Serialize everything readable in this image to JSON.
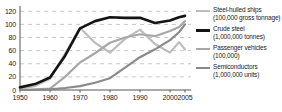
{
  "chart_data": {
    "type": "line",
    "title": "",
    "subtitle": "",
    "xlabel": "",
    "ylabel": "",
    "xlim": [
      1950,
      2007
    ],
    "ylim": [
      0,
      125
    ],
    "grid": true,
    "grid_style": "dashed-horizontal",
    "legend_position": "right",
    "y_ticks": [
      0,
      20,
      40,
      60,
      80,
      100,
      120
    ],
    "x_ticks": [
      1950,
      1960,
      1970,
      1980,
      1990,
      2000,
      2005
    ],
    "x_tick_labels": [
      "1950",
      "1960",
      "1970",
      "1980",
      "1990",
      "2000",
      "2005"
    ],
    "y_tick_labels": [
      "0",
      "20",
      "40",
      "60",
      "80",
      "100",
      "120"
    ],
    "series": [
      {
        "name": "Steel-hulled ships",
        "unit": "(100,000 gross tonnage)",
        "color": "#bdbdbd",
        "width": 2.2,
        "x": [
          1950,
          1955,
          1960,
          1965,
          1970,
          1975,
          1980,
          1985,
          1990,
          1995,
          2000,
          2003,
          2005
        ],
        "y": [
          2,
          6,
          17,
          55,
          95,
          72,
          57,
          78,
          92,
          70,
          57,
          73,
          62
        ]
      },
      {
        "name": "Crude steel",
        "unit": "(1,000,000 tonnes)",
        "color": "#141414",
        "width": 2.6,
        "x": [
          1950,
          1955,
          1960,
          1965,
          1970,
          1975,
          1980,
          1985,
          1990,
          1995,
          2000,
          2003,
          2005
        ],
        "y": [
          4,
          9,
          19,
          52,
          94,
          105,
          111,
          110,
          110,
          102,
          106,
          111,
          113
        ]
      },
      {
        "name": "Passenger vehicles",
        "unit": "(100,000)",
        "color": "#a8a8a8",
        "width": 2.2,
        "x": [
          1950,
          1955,
          1960,
          1965,
          1970,
          1975,
          1980,
          1985,
          1990,
          1995,
          2000,
          2003,
          2005
        ],
        "y": [
          0,
          1,
          2,
          20,
          42,
          56,
          72,
          80,
          85,
          82,
          90,
          96,
          105
        ]
      },
      {
        "name": "Semiconductors",
        "unit": "(1,000,000 units)",
        "color": "#8a8a8a",
        "width": 2.2,
        "x": [
          1950,
          1955,
          1960,
          1965,
          1970,
          1975,
          1980,
          1985,
          1990,
          1995,
          2000,
          2003,
          2005
        ],
        "y": [
          0,
          0,
          1,
          3,
          6,
          11,
          18,
          34,
          50,
          62,
          76,
          88,
          100
        ]
      }
    ]
  },
  "legend": {
    "items": [
      {
        "label": "Steel-hulled ships",
        "unit": "(100,000 gross tonnage)",
        "color": "#bdbdbd",
        "thick": false
      },
      {
        "label": "Crude steel",
        "unit": "(1,000,000 tonnes)",
        "color": "#141414",
        "thick": true
      },
      {
        "label": "Passenger vehicles",
        "unit": "(100,000)",
        "color": "#a8a8a8",
        "thick": false
      },
      {
        "label": "Semiconductors",
        "unit": "(1,000,000 units)",
        "color": "#8a8a8a",
        "thick": false
      }
    ]
  },
  "axes": {
    "axis_color": "#555555",
    "grid_color": "#c9c9c9"
  }
}
